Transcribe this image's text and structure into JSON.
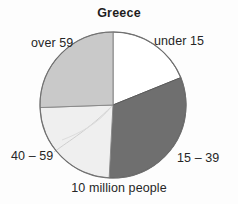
{
  "chart_data": {
    "type": "pie",
    "title": "Greece",
    "caption": "10 million people",
    "total_label": "10 million people",
    "total_value": 10,
    "total_units": "million people",
    "categories": [
      "under 15",
      "15 – 39",
      "40 – 59",
      "over 59"
    ],
    "values": [
      19,
      32,
      24,
      25
    ],
    "units": "percent of population",
    "start_angle_deg": 0,
    "direction": "clockwise",
    "legend": "none",
    "labels_position": "outside",
    "slices": [
      {
        "label": "under 15",
        "value": 19,
        "start_deg": 0,
        "end_deg": 68,
        "color": "#ffffff",
        "stroke": "#6e6e6e"
      },
      {
        "label": "15 – 39",
        "value": 32,
        "start_deg": 68,
        "end_deg": 183,
        "color": "#6f6f6f",
        "stroke": "#5a5a5a"
      },
      {
        "label": "40 – 59",
        "value": 24,
        "start_deg": 183,
        "end_deg": 268,
        "color": "#efefef",
        "stroke": "#8a8a8a"
      },
      {
        "label": "over 59",
        "value": 25,
        "start_deg": 268,
        "end_deg": 360,
        "color": "#c9c9c9",
        "stroke": "#8a8a8a"
      }
    ],
    "xlabel": "",
    "ylabel": ""
  },
  "labels": {
    "over_59": "over 59",
    "under_15": "under 15",
    "age_40_59": "40 – 59",
    "age_15_39": "15 – 39"
  },
  "colors": {
    "under_15": "#ffffff",
    "age_15_39": "#6f6f6f",
    "age_40_59": "#efefef",
    "over_59": "#c9c9c9",
    "outline": "#6e6e6e",
    "text": "#262626"
  }
}
